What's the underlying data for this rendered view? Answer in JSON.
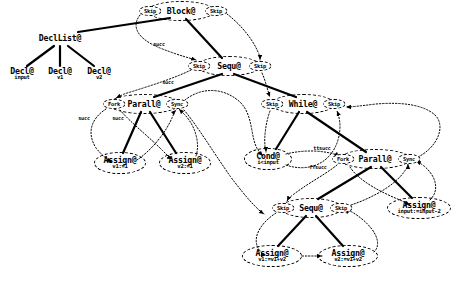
{
  "diagram": {
    "colors": {
      "ink": "#000000",
      "background": "#ffffff"
    },
    "nodes": [
      {
        "id": "block",
        "main": "Block@",
        "sub": "",
        "x": 181,
        "y": 11,
        "rx": 34,
        "ry": 10
      },
      {
        "id": "decllist",
        "main": "DeclList@",
        "sub": "",
        "x": 60,
        "y": 38,
        "rx": 0,
        "ry": 0
      },
      {
        "id": "decl1",
        "main": "Decl@",
        "sub": "input",
        "x": 22,
        "y": 74,
        "rx": 0,
        "ry": 0
      },
      {
        "id": "decl2",
        "main": "Decl@",
        "sub": "v1",
        "x": 60,
        "y": 74,
        "rx": 0,
        "ry": 0
      },
      {
        "id": "decl3",
        "main": "Decl@",
        "sub": "v2",
        "x": 99,
        "y": 74,
        "rx": 0,
        "ry": 0
      },
      {
        "id": "sequ1",
        "main": "Sequ@",
        "sub": "",
        "x": 229,
        "y": 66,
        "rx": 32,
        "ry": 10
      },
      {
        "id": "parall1",
        "main": "Parall@",
        "sub": "",
        "x": 144,
        "y": 104,
        "rx": 36,
        "ry": 10
      },
      {
        "id": "assign1",
        "main": "Assign@",
        "sub": "v1:=1",
        "x": 120,
        "y": 163,
        "rx": 26,
        "ry": 11
      },
      {
        "id": "assign2",
        "main": "Assign@",
        "sub": "v2:=1",
        "x": 185,
        "y": 163,
        "rx": 26,
        "ry": 11
      },
      {
        "id": "while",
        "main": "While@",
        "sub": "",
        "x": 303,
        "y": 104,
        "rx": 32,
        "ry": 10
      },
      {
        "id": "cond",
        "main": "Cond@",
        "sub": "i<input",
        "x": 268,
        "y": 159,
        "rx": 24,
        "ry": 11
      },
      {
        "id": "parall2",
        "main": "Parall@",
        "sub": "",
        "x": 375,
        "y": 159,
        "rx": 36,
        "ry": 10
      },
      {
        "id": "sequ2",
        "main": "Sequ@",
        "sub": "",
        "x": 311,
        "y": 208,
        "rx": 31,
        "ry": 10
      },
      {
        "id": "assign3",
        "main": "Assign@",
        "sub": "v1:=v1+v2",
        "x": 272,
        "y": 256,
        "rx": 30,
        "ry": 11
      },
      {
        "id": "assign4",
        "main": "Assign@",
        "sub": "v2:=v1+v2",
        "x": 348,
        "y": 256,
        "rx": 30,
        "ry": 11
      },
      {
        "id": "assign5",
        "main": "Assign@",
        "sub": "input:=input-2",
        "x": 419,
        "y": 208,
        "rx": 32,
        "ry": 11
      }
    ],
    "ports": [
      {
        "id": "p-block-in",
        "label": "Skip",
        "x": 150,
        "y": 11,
        "w": 23,
        "h": 10
      },
      {
        "id": "p-block-out",
        "label": "Skip",
        "x": 216,
        "y": 11,
        "w": 23,
        "h": 10
      },
      {
        "id": "p-sequ1-in",
        "label": "Skip",
        "x": 199,
        "y": 66,
        "w": 23,
        "h": 10
      },
      {
        "id": "p-sequ1-out",
        "label": "Skip",
        "x": 260,
        "y": 66,
        "w": 23,
        "h": 10
      },
      {
        "id": "p-parall1-fork",
        "label": "Fork",
        "x": 114,
        "y": 104,
        "w": 23,
        "h": 10
      },
      {
        "id": "p-parall1-sync",
        "label": "Sync",
        "x": 177,
        "y": 104,
        "w": 23,
        "h": 10
      },
      {
        "id": "p-while-in",
        "label": "Skip",
        "x": 272,
        "y": 104,
        "w": 23,
        "h": 10
      },
      {
        "id": "p-while-out",
        "label": "Skip",
        "x": 334,
        "y": 104,
        "w": 23,
        "h": 10
      },
      {
        "id": "p-parall2-fork",
        "label": "Fork",
        "x": 343,
        "y": 159,
        "w": 23,
        "h": 10
      },
      {
        "id": "p-parall2-sync",
        "label": "Sync",
        "x": 409,
        "y": 159,
        "w": 23,
        "h": 10
      },
      {
        "id": "p-sequ2-in",
        "label": "Skip",
        "x": 283,
        "y": 208,
        "w": 23,
        "h": 10
      },
      {
        "id": "p-sequ2-out",
        "label": "Skip",
        "x": 341,
        "y": 208,
        "w": 23,
        "h": 10
      }
    ],
    "edge_labels": [
      {
        "id": "lbl-succ-1",
        "text": "succ",
        "x": 159,
        "y": 44
      },
      {
        "id": "lbl-succ-2",
        "text": "succ",
        "x": 168,
        "y": 82
      },
      {
        "id": "lbl-succ-3",
        "text": "succ",
        "x": 84,
        "y": 118
      },
      {
        "id": "lbl-succ-4",
        "text": "succ",
        "x": 118,
        "y": 118
      },
      {
        "id": "lbl-ttsucc",
        "text": "ttsucc",
        "x": 322,
        "y": 148
      },
      {
        "id": "lbl-ffsucc",
        "text": "ffsucc",
        "x": 318,
        "y": 167
      }
    ],
    "tree_edges": [
      [
        "block",
        "decllist"
      ],
      [
        "block",
        "sequ1"
      ],
      [
        "decllist",
        "decl1"
      ],
      [
        "decllist",
        "decl2"
      ],
      [
        "decllist",
        "decl3"
      ],
      [
        "sequ1",
        "parall1"
      ],
      [
        "sequ1",
        "while"
      ],
      [
        "parall1",
        "assign1"
      ],
      [
        "parall1",
        "assign2"
      ],
      [
        "while",
        "cond"
      ],
      [
        "while",
        "parall2"
      ],
      [
        "parall2",
        "sequ2"
      ],
      [
        "parall2",
        "assign5"
      ],
      [
        "sequ2",
        "assign3"
      ],
      [
        "sequ2",
        "assign4"
      ]
    ]
  }
}
